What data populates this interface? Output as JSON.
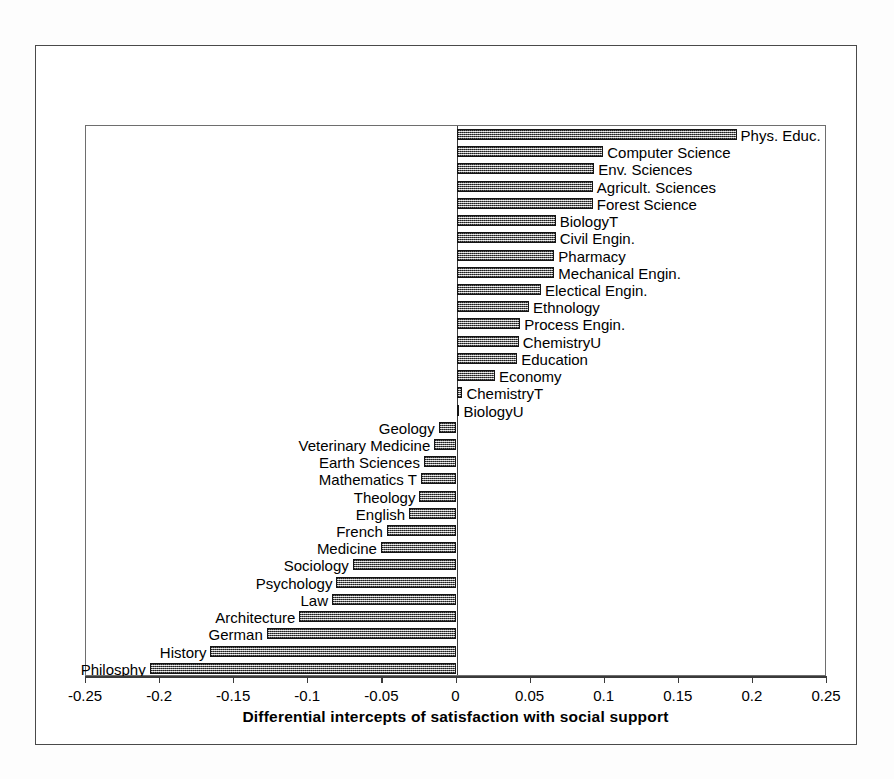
{
  "chart_data": {
    "type": "bar",
    "orientation": "horizontal",
    "title": "",
    "xlabel": "Differential intercepts of satisfaction with social support",
    "ylabel": "",
    "xlim": [
      -0.25,
      0.25
    ],
    "xticks": [
      "-0.25",
      "-0.2",
      "-0.15",
      "-0.1",
      "-0.05",
      "0",
      "0.05",
      "0.1",
      "0.15",
      "0.2",
      "0.25"
    ],
    "xtick_values": [
      -0.25,
      -0.2,
      -0.15,
      -0.1,
      -0.05,
      0,
      0.05,
      0.1,
      0.15,
      0.2,
      0.25
    ],
    "grid": false,
    "legend": null,
    "categories": [
      "Phys. Educ.",
      "Computer Science",
      "Env. Sciences",
      "Agricult. Sciences",
      "Forest Science",
      "BiologyT",
      "Civil Engin.",
      "Pharmacy",
      "Mechanical Engin.",
      "Electical Engin.",
      "Ethnology",
      "Process Engin.",
      "ChemistryU",
      "Education",
      "Economy",
      "ChemistryT",
      "BiologyU",
      "Geology",
      "Veterinary Medicine",
      "Earth Sciences",
      "Mathematics T",
      "Theology",
      "English",
      "French",
      "Medicine",
      "Sociology",
      "Psychology",
      "Law",
      "Architecture",
      "German",
      "History",
      "Philosphy"
    ],
    "values": [
      0.189,
      0.099,
      0.093,
      0.092,
      0.092,
      0.067,
      0.067,
      0.066,
      0.066,
      0.057,
      0.049,
      0.043,
      0.042,
      0.041,
      0.026,
      0.004,
      0.002,
      -0.012,
      -0.015,
      -0.022,
      -0.024,
      -0.025,
      -0.032,
      -0.047,
      -0.051,
      -0.07,
      -0.081,
      -0.084,
      -0.106,
      -0.128,
      -0.166,
      -0.207
    ],
    "bar_color": "#8a8a8a",
    "bar_edge_color": "#141414",
    "axis_color": "#3a3a3a"
  }
}
